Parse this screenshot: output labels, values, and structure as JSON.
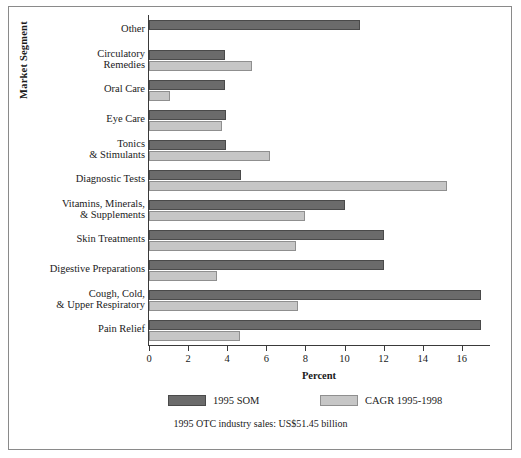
{
  "chart_data": {
    "type": "bar",
    "orientation": "horizontal",
    "title": "",
    "xlabel": "Percent",
    "ylabel": "Market Segment",
    "xlim": [
      0,
      17.4
    ],
    "grid": false,
    "xticks": [
      "0",
      "2",
      "4",
      "6",
      "8",
      "10",
      "12",
      "14",
      "16"
    ],
    "xtick_values": [
      0,
      2,
      4,
      6,
      8,
      10,
      12,
      14,
      16
    ],
    "legend_position": "bottom",
    "categories": [
      "Other",
      "Circulatory Remedies",
      "Oral Care",
      "Eye Care",
      "Tonics & Stimulants",
      "Diagnostic Tests",
      "Vitamins, Minerals, & Supplements",
      "Skin Treatments",
      "Digestive Preparations",
      "Cough, Cold, & Upper Respiratory",
      "Pain Relief"
    ],
    "category_lines": [
      [
        "Other"
      ],
      [
        "Circulatory",
        "Remedies"
      ],
      [
        "Oral Care"
      ],
      [
        "Eye Care"
      ],
      [
        "Tonics",
        "& Stimulants"
      ],
      [
        "Diagnostic Tests"
      ],
      [
        "Vitamins, Minerals,",
        "& Supplements"
      ],
      [
        "Skin Treatments"
      ],
      [
        "Digestive Preparations"
      ],
      [
        "Cough, Cold,",
        "& Upper Respiratory"
      ],
      [
        "Pain Relief"
      ]
    ],
    "series": [
      {
        "name": "1995 SOM",
        "color": "#6b6b6b",
        "values": [
          10.8,
          3.9,
          3.9,
          3.95,
          3.95,
          4.7,
          10.0,
          12.0,
          12.0,
          17.0,
          17.0
        ]
      },
      {
        "name": "CAGR 1995-1998",
        "color": "#c6c6c6",
        "values": [
          0,
          5.25,
          1.05,
          3.75,
          6.2,
          15.25,
          8.0,
          7.5,
          3.5,
          7.6,
          4.65
        ]
      }
    ]
  },
  "legend": {
    "items": [
      {
        "label": "1995 SOM"
      },
      {
        "label": "CAGR 1995-1998"
      }
    ]
  },
  "footnote": "1995 OTC industry sales: US$51.45 billion",
  "colors": {
    "som": "#6b6b6b",
    "cagr": "#c6c6c6",
    "axis": "#3a3a3a",
    "border": "#8a8a8a"
  }
}
